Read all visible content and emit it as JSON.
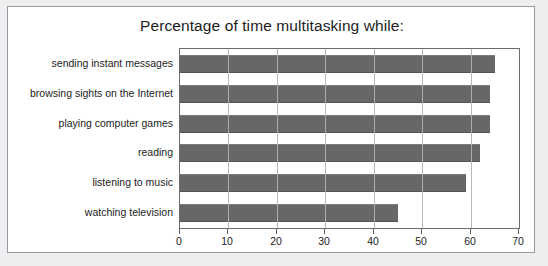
{
  "chart_data": {
    "type": "bar",
    "orientation": "horizontal",
    "title": "Percentage of time multitasking while:",
    "xlabel": "",
    "ylabel": "",
    "xlim": [
      0,
      70
    ],
    "xticks": [
      0,
      10,
      20,
      30,
      40,
      50,
      60,
      70
    ],
    "grid": true,
    "gridlines": "vertical",
    "legend": false,
    "bar_color": "#676767",
    "categories": [
      "sending instant messages",
      "browsing sights on the Internet",
      "playing computer games",
      "reading",
      "listening to music",
      "watching television"
    ],
    "values": [
      65,
      64,
      64,
      62,
      59,
      45
    ]
  },
  "colors": {
    "page_background": "#eeeef0",
    "card_background": "#ffffff",
    "card_border": "#9a9a9e",
    "plot_border": "#6d6d6d",
    "gridline": "#b9b9b9",
    "bar": "#676767",
    "text": "#1c1c1c"
  }
}
